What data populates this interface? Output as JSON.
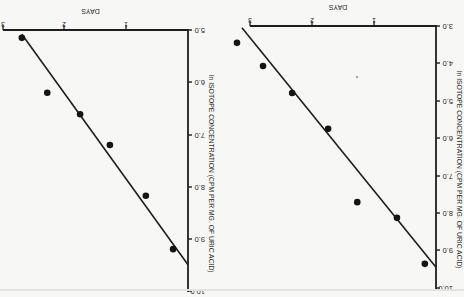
{
  "page": {
    "orientation": "rotated-180",
    "background": "#f7f7f5",
    "ink": "#1e1e1e"
  },
  "chart_data": [
    {
      "type": "scatter",
      "title": "",
      "xlabel": "DAYS",
      "ylabel": "ln ISOTOPE CONCENTRATION (CPM PER MG. OF URIC ACID)",
      "x_ticks": [
        "1",
        "2",
        "3"
      ],
      "y_ticks": [
        "5.0",
        "6.0",
        "7.0",
        "8.0",
        "9.0",
        "10.0"
      ],
      "xlim": [
        0,
        3
      ],
      "ylim": [
        5.0,
        10.0
      ],
      "grid": false,
      "legend": null,
      "series": [
        {
          "name": "observed",
          "x": [
            2.68,
            2.27,
            1.74,
            1.26,
            0.68,
            0.24
          ],
          "y": [
            5.15,
            6.2,
            6.61,
            7.2,
            8.17,
            9.19
          ]
        }
      ],
      "fit_line": {
        "x": [
          0.0,
          2.68
        ],
        "y": [
          9.49,
          5.08
        ]
      },
      "layout": {
        "origin_px": [
          188,
          30
        ],
        "px_per_day": 62,
        "px_per_unit": 52.3,
        "tick_x_px": [
          126,
          64,
          3
        ],
        "tick_y_px": [
          30,
          82,
          135,
          187,
          239,
          291
        ]
      }
    },
    {
      "type": "scatter",
      "title": "",
      "xlabel": "DAYS",
      "ylabel": "ln ISOTOPE CONCENTRATION (CPM PER MG. OF URIC ACID)",
      "x_ticks": [
        "1",
        "2",
        "3"
      ],
      "y_ticks": [
        "3.0",
        "4.0",
        "5.0",
        "6.0",
        "7.0",
        "8.0",
        "9.0",
        "10.0"
      ],
      "xlim": [
        0,
        3.3
      ],
      "ylim": [
        3.0,
        10.0
      ],
      "grid": false,
      "legend": null,
      "series": [
        {
          "name": "observed",
          "x": [
            3.21,
            2.79,
            2.32,
            1.74,
            1.27,
            0.63,
            0.18
          ],
          "y": [
            3.45,
            4.07,
            4.79,
            5.75,
            7.71,
            8.13,
            9.36
          ]
        }
      ],
      "fit_line": {
        "x": [
          0.0,
          3.13
        ],
        "y": [
          9.45,
          3.05
        ]
      },
      "layout": {
        "origin_px": [
          436,
          26
        ],
        "px_per_day": 62,
        "px_per_unit": 37.4,
        "tick_x_px": [
          374,
          312,
          250
        ],
        "tick_y_px": [
          26,
          63,
          101,
          138,
          176,
          213,
          250,
          288
        ]
      }
    }
  ]
}
